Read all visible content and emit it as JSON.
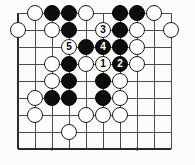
{
  "diagram": {
    "kind": "go-board-diagram",
    "board": {
      "columns": 10,
      "rows": 9,
      "origin_x": 18,
      "origin_y": 13,
      "cell_width": 17,
      "cell_height": 17,
      "line_color": "#4a4a4a",
      "edge_color": "#2b2b2b",
      "background_color": "#fdfdfb"
    },
    "star_points": [
      {
        "col": 7,
        "row": 3
      },
      {
        "col": 7,
        "row": 8
      },
      {
        "col": 2,
        "row": 8
      }
    ],
    "stone_colors": {
      "black": "#0d0d0d",
      "white": "#fefefe",
      "black_label": "#ffffff",
      "white_label": "#000000"
    },
    "stones": [
      {
        "col": 1,
        "row": 0,
        "color": "white",
        "label": ""
      },
      {
        "col": 2,
        "row": 0,
        "color": "black",
        "label": ""
      },
      {
        "col": 3,
        "row": 0,
        "color": "black",
        "label": ""
      },
      {
        "col": 4,
        "row": 0,
        "color": "white",
        "label": ""
      },
      {
        "col": 6,
        "row": 0,
        "color": "black",
        "label": ""
      },
      {
        "col": 7,
        "row": 0,
        "color": "black",
        "label": ""
      },
      {
        "col": 8,
        "row": 0,
        "color": "white",
        "label": ""
      },
      {
        "col": 0,
        "row": 1,
        "color": "white",
        "label": ""
      },
      {
        "col": 2,
        "row": 1,
        "color": "white",
        "label": ""
      },
      {
        "col": 3,
        "row": 1,
        "color": "black",
        "label": ""
      },
      {
        "col": 5,
        "row": 1,
        "color": "white",
        "label": "3"
      },
      {
        "col": 6,
        "row": 1,
        "color": "black",
        "label": ""
      },
      {
        "col": 7,
        "row": 1,
        "color": "white",
        "label": ""
      },
      {
        "col": 9,
        "row": 1,
        "color": "white",
        "label": ""
      },
      {
        "col": 3,
        "row": 2,
        "color": "white",
        "label": "5"
      },
      {
        "col": 4,
        "row": 2,
        "color": "black",
        "label": ""
      },
      {
        "col": 5,
        "row": 2,
        "color": "black",
        "label": "4"
      },
      {
        "col": 6,
        "row": 2,
        "color": "black",
        "label": ""
      },
      {
        "col": 7,
        "row": 2,
        "color": "white",
        "label": ""
      },
      {
        "col": 2,
        "row": 3,
        "color": "white",
        "label": ""
      },
      {
        "col": 3,
        "row": 3,
        "color": "black",
        "label": ""
      },
      {
        "col": 4,
        "row": 3,
        "color": "white",
        "label": ""
      },
      {
        "col": 5,
        "row": 3,
        "color": "white",
        "label": "1"
      },
      {
        "col": 6,
        "row": 3,
        "color": "black",
        "label": "2"
      },
      {
        "col": 7,
        "row": 3,
        "color": "white",
        "label": ""
      },
      {
        "col": 2,
        "row": 4,
        "color": "white",
        "label": ""
      },
      {
        "col": 3,
        "row": 4,
        "color": "black",
        "label": ""
      },
      {
        "col": 5,
        "row": 4,
        "color": "black",
        "label": ""
      },
      {
        "col": 6,
        "row": 4,
        "color": "white",
        "label": ""
      },
      {
        "col": 1,
        "row": 5,
        "color": "white",
        "label": ""
      },
      {
        "col": 2,
        "row": 5,
        "color": "black",
        "label": ""
      },
      {
        "col": 3,
        "row": 5,
        "color": "black",
        "label": ""
      },
      {
        "col": 5,
        "row": 5,
        "color": "black",
        "label": ""
      },
      {
        "col": 6,
        "row": 5,
        "color": "white",
        "label": ""
      },
      {
        "col": 1,
        "row": 6,
        "color": "white",
        "label": ""
      },
      {
        "col": 4,
        "row": 6,
        "color": "white",
        "label": ""
      },
      {
        "col": 5,
        "row": 6,
        "color": "white",
        "label": ""
      },
      {
        "col": 6,
        "row": 6,
        "color": "white",
        "label": ""
      },
      {
        "col": 3,
        "row": 7,
        "color": "white",
        "label": ""
      }
    ],
    "move_sequence": [
      {
        "number": "1",
        "color": "white",
        "col": 5,
        "row": 3
      },
      {
        "number": "2",
        "color": "black",
        "col": 6,
        "row": 3
      },
      {
        "number": "3",
        "color": "white",
        "col": 5,
        "row": 1
      },
      {
        "number": "4",
        "color": "black",
        "col": 5,
        "row": 2
      },
      {
        "number": "5",
        "color": "white",
        "col": 3,
        "row": 2
      }
    ]
  }
}
